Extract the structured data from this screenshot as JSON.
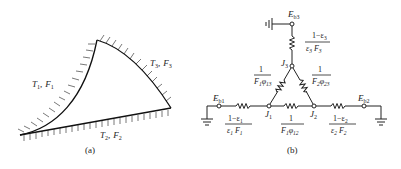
{
  "figure_a": {
    "caption": "(a)",
    "surfaces": [
      {
        "id": "1",
        "T": "T",
        "T_sub": "1",
        "F": "F",
        "F_sub": "1",
        "sep": ","
      },
      {
        "id": "2",
        "T": "T",
        "T_sub": "2",
        "F": "F",
        "F_sub": "2",
        "sep": ","
      },
      {
        "id": "3",
        "T": "T",
        "T_sub": "3",
        "F": "F",
        "F_sub": "3",
        "sep": ","
      }
    ]
  },
  "figure_b": {
    "caption": "(b)",
    "nodes": {
      "Eb1": {
        "main": "E",
        "sub": "b1"
      },
      "Eb2": {
        "main": "E",
        "sub": "b2"
      },
      "Eb3": {
        "main": "E",
        "sub": "b3"
      },
      "J1": {
        "main": "J",
        "sub": "1"
      },
      "J2": {
        "main": "J",
        "sub": "2"
      },
      "J3": {
        "main": "J",
        "sub": "3"
      }
    },
    "resistances": {
      "R1": {
        "num": "1−ε",
        "num_sub": "1",
        "den_a": "ε",
        "den_a_sub": "1",
        "den_b": "F",
        "den_b_sub": "1"
      },
      "R2": {
        "num": "1−ε",
        "num_sub": "2",
        "den_a": "ε",
        "den_a_sub": "2",
        "den_b": "F",
        "den_b_sub": "2"
      },
      "R3": {
        "num": "1−ε",
        "num_sub": "3",
        "den_a": "ε",
        "den_a_sub": "3",
        "den_b": "F",
        "den_b_sub": "3"
      },
      "R12": {
        "num": "1",
        "den_a": "F",
        "den_a_sub": "1",
        "den_b": "φ",
        "den_b_sub": "12"
      },
      "R13": {
        "num": "1",
        "den_a": "F",
        "den_a_sub": "1",
        "den_b": "φ",
        "den_b_sub": "13"
      },
      "R23": {
        "num": "1",
        "den_a": "F",
        "den_a_sub": "2",
        "den_b": "φ",
        "den_b_sub": "23"
      }
    }
  }
}
